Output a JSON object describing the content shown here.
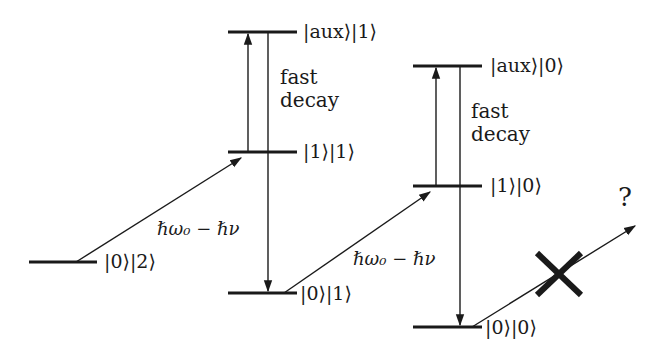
{
  "diagram": {
    "type": "energy-level-diagram",
    "levels": [
      {
        "id": "l02",
        "label": "|0⟩|2⟩"
      },
      {
        "id": "l11",
        "label": "|1⟩|1⟩"
      },
      {
        "id": "aux1",
        "label": "|aux⟩|1⟩"
      },
      {
        "id": "l01",
        "label": "|0⟩|1⟩"
      },
      {
        "id": "l10",
        "label": "|1⟩|0⟩"
      },
      {
        "id": "aux0",
        "label": "|aux⟩|0⟩"
      },
      {
        "id": "l00",
        "label": "|0⟩|0⟩"
      }
    ],
    "transitions": [
      {
        "from": "l02",
        "to": "l11",
        "label": "ℏω₀ − ℏν"
      },
      {
        "from": "l11",
        "to": "aux1",
        "label": ""
      },
      {
        "from": "aux1",
        "to": "l01",
        "label": "fast decay"
      },
      {
        "from": "l01",
        "to": "l10",
        "label": "ℏω₀ − ℏν"
      },
      {
        "from": "l10",
        "to": "aux0",
        "label": ""
      },
      {
        "from": "aux0",
        "to": "l00",
        "label": "fast decay"
      },
      {
        "from": "l00",
        "to": "unknown",
        "label": "?",
        "blocked": true
      }
    ],
    "labels": {
      "decay1_line1": "fast",
      "decay1_line2": "decay",
      "decay2_line1": "fast",
      "decay2_line2": "decay",
      "photon1": "ℏω₀ − ℏν",
      "photon2": "ℏω₀ − ℏν",
      "question": "?"
    },
    "colors": {
      "line": "#1a1a1a",
      "background": "#ffffff"
    }
  }
}
